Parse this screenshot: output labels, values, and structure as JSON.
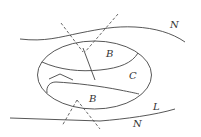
{
  "diagram": {
    "labels": {
      "n_top": "N",
      "b_top": "B",
      "c": "C",
      "b_bottom": "B",
      "l": "L",
      "n_bottom": "N"
    },
    "colors": {
      "stroke": "#444444",
      "background": "#ffffff"
    }
  }
}
